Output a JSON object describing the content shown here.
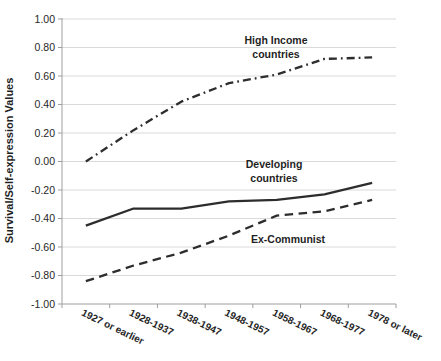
{
  "chart_data": {
    "type": "line",
    "title": "",
    "xlabel": "",
    "ylabel": "Survival/Self-expression Values",
    "ylim": [
      -1.0,
      1.0
    ],
    "ytick_step": 0.2,
    "ytick_format": "two-decimals",
    "grid": "horizontal-light-gray",
    "legend_position": "none (inline text annotations next to lines)",
    "x_label_rotation_deg": 26,
    "categories": [
      "1927 or earlier",
      "1928-1937",
      "1938-1947",
      "1948-1957",
      "1958-1967",
      "1968-1977",
      "1978 or later"
    ],
    "series": [
      {
        "name": "High Income countries",
        "style": "dash-dot",
        "values": [
          0.0,
          0.22,
          0.42,
          0.55,
          0.61,
          0.72,
          0.73
        ]
      },
      {
        "name": "Developing countries",
        "style": "solid",
        "values": [
          -0.45,
          -0.33,
          -0.33,
          -0.28,
          -0.27,
          -0.23,
          -0.15
        ]
      },
      {
        "name": "Ex-Communist",
        "style": "dashed",
        "values": [
          -0.84,
          -0.73,
          -0.64,
          -0.52,
          -0.38,
          -0.35,
          -0.27
        ]
      }
    ],
    "annotations": {
      "high_income": {
        "line1": "High Income",
        "line2": "countries"
      },
      "developing": {
        "line1": "Developing",
        "line2": "countries"
      },
      "ex_communist": {
        "line1": "Ex-Communist"
      }
    }
  },
  "colors": {
    "line": "#2d2d2d",
    "grid": "#d9d9d9",
    "axis": "#9e9e9e",
    "text": "#262626"
  }
}
